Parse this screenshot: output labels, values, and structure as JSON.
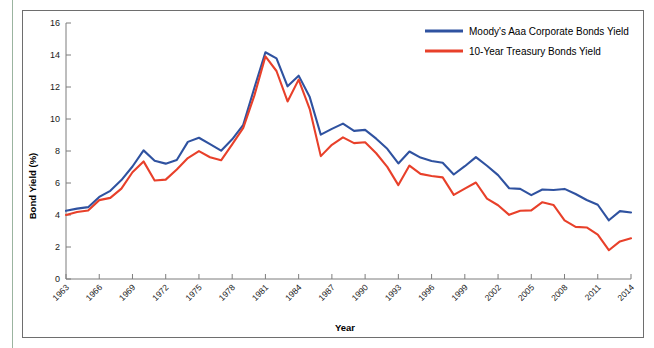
{
  "figure": {
    "background_color": "#ffffff",
    "frame_color": "#6e6e6e",
    "margin_rule_color": "#9bb4a0"
  },
  "axes": {
    "y_title": "Bond Yield (%)",
    "x_title": "Year",
    "y_ticks": [
      "0",
      "2",
      "4",
      "6",
      "8",
      "10",
      "12",
      "14",
      "16"
    ],
    "x_ticks": [
      "1963",
      "1966",
      "1969",
      "1972",
      "1975",
      "1978",
      "1981",
      "1984",
      "1987",
      "1990",
      "1993",
      "1996",
      "1999",
      "2002",
      "2005",
      "2008",
      "2011",
      "2014"
    ]
  },
  "legend": {
    "position": "top-right",
    "entries": [
      {
        "label": "Moody's Aaa Corporate Bonds Yield",
        "color": "#2f52a0"
      },
      {
        "label": "10-Year Treasury Bonds Yield",
        "color": "#e8402a"
      }
    ]
  },
  "chart_data": {
    "type": "line",
    "title": "",
    "xlabel": "Year",
    "ylabel": "Bond Yield (%)",
    "xlim": [
      1963,
      2014
    ],
    "ylim": [
      0,
      16
    ],
    "ytick_step": 2,
    "xtick_step": 3,
    "grid": false,
    "legend_position": "top-right",
    "x": [
      1963,
      1964,
      1965,
      1966,
      1967,
      1968,
      1969,
      1970,
      1971,
      1972,
      1973,
      1974,
      1975,
      1976,
      1977,
      1978,
      1979,
      1980,
      1981,
      1982,
      1983,
      1984,
      1985,
      1986,
      1987,
      1988,
      1989,
      1990,
      1991,
      1992,
      1993,
      1994,
      1995,
      1996,
      1997,
      1998,
      1999,
      2000,
      2001,
      2002,
      2003,
      2004,
      2005,
      2006,
      2007,
      2008,
      2009,
      2010,
      2011,
      2012,
      2013,
      2014
    ],
    "series": [
      {
        "name": "Moody's Aaa Corporate Bonds Yield",
        "color": "#2f52a0",
        "values": [
          4.26,
          4.4,
          4.49,
          5.13,
          5.51,
          6.18,
          7.03,
          8.04,
          7.39,
          7.21,
          7.44,
          8.57,
          8.83,
          8.43,
          8.02,
          8.73,
          9.63,
          11.94,
          14.17,
          13.79,
          12.04,
          12.71,
          11.37,
          9.02,
          9.38,
          9.71,
          9.26,
          9.32,
          8.77,
          8.14,
          7.22,
          7.97,
          7.59,
          7.37,
          7.27,
          6.53,
          7.05,
          7.62,
          7.08,
          6.49,
          5.67,
          5.63,
          5.24,
          5.59,
          5.56,
          5.63,
          5.31,
          4.94,
          4.64,
          3.67,
          4.24,
          4.16
        ]
      },
      {
        "name": "10-Year Treasury Bonds Yield",
        "color": "#e8402a",
        "values": [
          4.0,
          4.19,
          4.28,
          4.93,
          5.07,
          5.65,
          6.67,
          7.35,
          6.16,
          6.21,
          6.84,
          7.56,
          7.99,
          7.61,
          7.42,
          8.41,
          9.44,
          11.46,
          13.91,
          13.0,
          11.1,
          12.46,
          10.62,
          7.68,
          8.39,
          8.85,
          8.49,
          8.55,
          7.86,
          7.01,
          5.87,
          7.09,
          6.57,
          6.44,
          6.35,
          5.26,
          5.65,
          6.03,
          5.02,
          4.61,
          4.01,
          4.27,
          4.29,
          4.8,
          4.63,
          3.66,
          3.26,
          3.22,
          2.78,
          1.8,
          2.35,
          2.54
        ]
      }
    ]
  }
}
